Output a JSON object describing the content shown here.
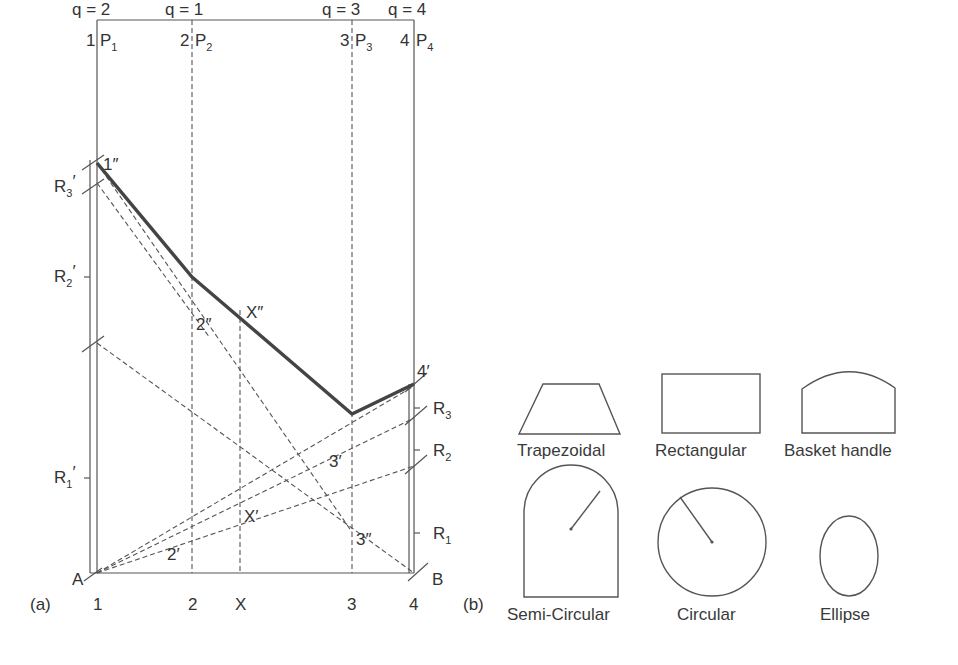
{
  "panel_a": {
    "tag": "(a)",
    "q_labels": [
      "q = 2",
      "q = 1",
      "q = 3",
      "q = 4"
    ],
    "section_numbers_top": [
      "1",
      "2",
      "3",
      "4"
    ],
    "section_points": [
      "P",
      "P",
      "P",
      "P"
    ],
    "section_subscripts": [
      "1",
      "2",
      "3",
      "4"
    ],
    "bottom_labels": [
      "1",
      "2",
      "X",
      "3",
      "4"
    ],
    "left_reactions": [
      {
        "base": "R",
        "sub": "3",
        "prime": "′"
      },
      {
        "base": "R",
        "sub": "2",
        "prime": "′"
      },
      {
        "base": "R",
        "sub": "1",
        "prime": "′"
      }
    ],
    "right_reactions": [
      {
        "base": "R",
        "sub": "3"
      },
      {
        "base": "R",
        "sub": "2"
      },
      {
        "base": "R",
        "sub": "1"
      }
    ],
    "points": {
      "one_double": "1″",
      "two_double": "2″",
      "x_double": "X″",
      "three_double": "3″",
      "four_prime": "4′",
      "three_prime": "3′",
      "x_prime": "X′",
      "two_prime": "2′",
      "A": "A",
      "B": "B"
    }
  },
  "panel_b": {
    "tag": "(b)",
    "shapes": [
      {
        "name": "trapezoidal",
        "label": "Trapezoidal"
      },
      {
        "name": "rectangular",
        "label": "Rectangular"
      },
      {
        "name": "basket-handle",
        "label": "Basket handle"
      },
      {
        "name": "semi-circular",
        "label": "Semi-Circular"
      },
      {
        "name": "circular",
        "label": "Circular"
      },
      {
        "name": "ellipse",
        "label": "Ellipse"
      }
    ]
  }
}
